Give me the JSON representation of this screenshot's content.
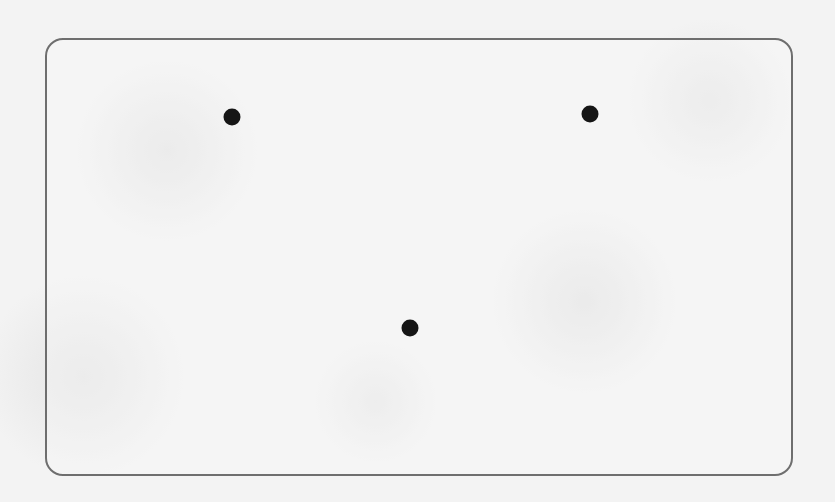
{
  "card": {
    "type": "dice-face",
    "pip_count": 3,
    "colors": {
      "border": "#6e6e6e",
      "pip": "#151515",
      "background": "#f3f3f3"
    },
    "pips": [
      {
        "x": 232,
        "y": 117
      },
      {
        "x": 590,
        "y": 114
      },
      {
        "x": 410,
        "y": 328
      }
    ]
  }
}
